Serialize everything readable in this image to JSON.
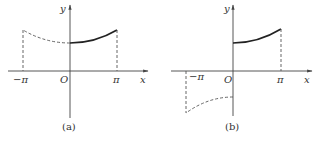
{
  "figure": {
    "panels": [
      {
        "id": "a",
        "caption": "(a)",
        "x_axis_label": "x",
        "y_axis_label": "y",
        "origin_label": "O",
        "tick_labels": [
          "−π",
          "π"
        ],
        "description": "Even extension: solid curve on [0, π], dashed mirror curve on [−π, 0], dashed verticals at ±π"
      },
      {
        "id": "b",
        "caption": "(b)",
        "x_axis_label": "x",
        "y_axis_label": "y",
        "origin_label": "O",
        "tick_labels": [
          "−π",
          "π"
        ],
        "description": "Odd extension: solid curve on [0, π], dashed point-reflected curve on [−π, 0] below x-axis, dashed verticals at ±π"
      }
    ]
  },
  "colors": {
    "axis": "#444444",
    "curve": "#222222",
    "dashed": "#555555"
  }
}
